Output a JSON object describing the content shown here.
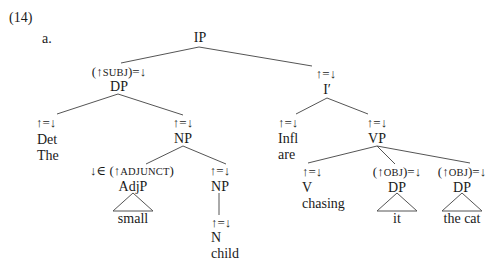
{
  "example": {
    "number": "(14)",
    "sublabel": "a."
  },
  "tree": {
    "root": {
      "label": "IP"
    },
    "subj": {
      "annotation_pre": "(↑",
      "annotation_sc": "SUBJ",
      "annotation_post": ")=↓",
      "label": "DP"
    },
    "det": {
      "annotation": "↑=↓",
      "label": "Det",
      "word": "The"
    },
    "np_upper": {
      "annotation": "↑=↓",
      "label": "NP"
    },
    "adjp": {
      "annotation_pre": "↓∈ (↑",
      "annotation_sc": "ADJUNCT",
      "annotation_post": ")",
      "label": "AdjP",
      "word": "small"
    },
    "np_lower": {
      "annotation": "↑=↓",
      "label": "NP"
    },
    "n": {
      "annotation": "↑=↓",
      "label": "N",
      "word": "child"
    },
    "ibar": {
      "annotation": "↑=↓",
      "label": "I′"
    },
    "infl": {
      "annotation": "↑=↓",
      "label": "Infl",
      "word": "are"
    },
    "vp": {
      "annotation": "↑=↓",
      "label": "VP"
    },
    "v": {
      "annotation": "↑=↓",
      "label": "V",
      "word": "chasing"
    },
    "obj1": {
      "annotation_pre": "(↑",
      "annotation_sc": "OBJ",
      "annotation_post": ")=↓",
      "label": "DP",
      "word": "it"
    },
    "obj2": {
      "annotation_pre": "(↑",
      "annotation_sc": "OBJ",
      "annotation_post": ")=↓",
      "label": "DP",
      "word": "the cat"
    }
  },
  "colors": {
    "text": "#1a1a1a",
    "lines": "#555555",
    "background": "#ffffff"
  }
}
